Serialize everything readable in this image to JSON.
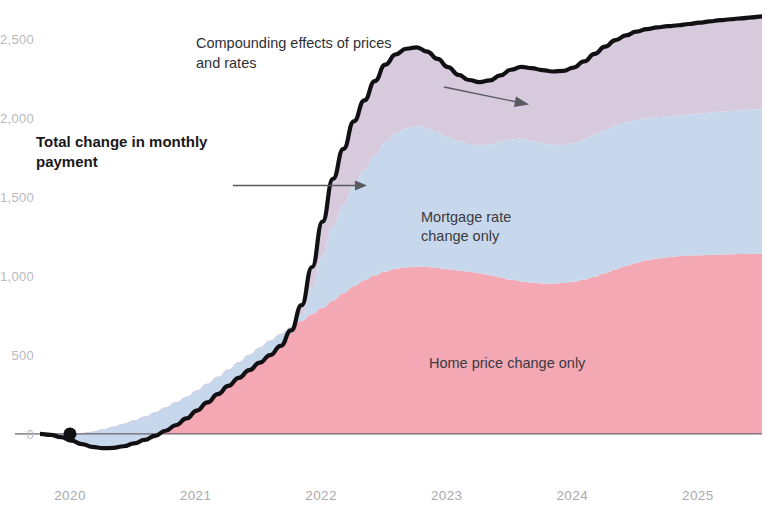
{
  "chart_data": {
    "type": "area",
    "title": "",
    "subtitle": "",
    "xlabel": "",
    "ylabel": "",
    "stacked": true,
    "grid": false,
    "legend": "inline-labels",
    "xlim": [
      2020.0,
      2025.75
    ],
    "ylim": [
      -330,
      2750
    ],
    "y_ticks": [
      0,
      500,
      1000,
      1500,
      2000,
      2500
    ],
    "y_tick_labels": [
      "0",
      "500",
      "1,000",
      "1,500",
      "2,000",
      "$2,500"
    ],
    "x_ticks": [
      2020,
      2021,
      2022,
      2023,
      2024,
      2025
    ],
    "x_tick_labels": [
      "2020",
      "2021",
      "2022",
      "2023",
      "2024",
      "2025"
    ],
    "colors": {
      "home_price": "#f4a8b4",
      "mortgage_rate": "#c8d8ec",
      "compounding": "#d6cadc",
      "total_line": "#111114",
      "zero_line": "#6e6470",
      "axis_text": "#b0b0b5"
    },
    "series": [
      {
        "name": "Home price change only",
        "key": "home_price",
        "color": "#f4a8b4",
        "values": [
          0,
          2,
          4,
          3,
          6,
          14,
          28,
          45,
          64,
          86,
          110,
          138,
          168,
          200,
          236,
          276,
          318,
          362,
          408,
          455,
          502,
          548,
          592,
          634,
          676,
          716,
          758,
          800,
          846,
          892,
          936,
          974,
          1006,
          1030,
          1046,
          1056,
          1060,
          1058,
          1052,
          1044,
          1036,
          1028,
          1018,
          1006,
          992,
          978,
          966,
          958,
          954,
          952,
          956,
          964,
          978,
          996,
          1018,
          1042,
          1064,
          1084,
          1100,
          1112,
          1120,
          1126,
          1130,
          1132,
          1134,
          1136,
          1138,
          1140,
          1142,
          1144
        ]
      },
      {
        "name": "Mortgage rate change only",
        "key": "mortgage_rate",
        "color": "#c8d8ec",
        "values": [
          0,
          -8,
          -24,
          -46,
          -70,
          -96,
          -118,
          -134,
          -142,
          -146,
          -148,
          -150,
          -148,
          -144,
          -138,
          -128,
          -118,
          -110,
          -104,
          -100,
          -98,
          -96,
          -92,
          -80,
          -40,
          40,
          170,
          330,
          470,
          560,
          640,
          700,
          760,
          820,
          860,
          880,
          890,
          880,
          860,
          840,
          820,
          810,
          812,
          830,
          860,
          890,
          905,
          900,
          890,
          880,
          875,
          878,
          888,
          900,
          908,
          912,
          910,
          905,
          900,
          896,
          894,
          892,
          894,
          898,
          902,
          906,
          908,
          910,
          912,
          914
        ]
      },
      {
        "name": "Compounding effects of prices and rates",
        "key": "compounding",
        "color": "#d6cadc",
        "values": [
          0,
          0,
          0,
          0,
          0,
          0,
          0,
          0,
          0,
          0,
          0,
          0,
          0,
          0,
          0,
          0,
          0,
          0,
          0,
          0,
          0,
          0,
          0,
          4,
          20,
          60,
          130,
          215,
          300,
          355,
          405,
          440,
          470,
          490,
          500,
          505,
          500,
          485,
          465,
          440,
          420,
          405,
          400,
          405,
          420,
          440,
          455,
          460,
          462,
          465,
          470,
          480,
          495,
          512,
          528,
          542,
          552,
          560,
          565,
          568,
          570,
          572,
          574,
          576,
          578,
          580,
          582,
          584,
          586,
          588
        ]
      }
    ],
    "total_line": {
      "name": "Total change in monthly payment",
      "values": [
        0,
        -6,
        -20,
        -43,
        -64,
        -82,
        -90,
        -89,
        -78,
        -60,
        -38,
        -12,
        20,
        56,
        98,
        148,
        200,
        252,
        304,
        355,
        404,
        452,
        500,
        558,
        656,
        816,
        1058,
        1345,
        1616,
        1807,
        1981,
        2114,
        2236,
        2340,
        2406,
        2441,
        2450,
        2423,
        2377,
        2324,
        2276,
        2243,
        2230,
        2241,
        2272,
        2308,
        2326,
        2318,
        2306,
        2297,
        2301,
        2322,
        2361,
        2408,
        2454,
        2496,
        2526,
        2549,
        2565,
        2576,
        2584,
        2590,
        2598,
        2606,
        2614,
        2622,
        2628,
        2634,
        2640,
        2646
      ]
    },
    "origin_marker": {
      "x": 2020.0,
      "y": 0,
      "shape": "dot"
    }
  },
  "annotations": [
    {
      "id": "compounding-annotation",
      "lines": [
        "Compounding effects of prices",
        "and rates"
      ],
      "bold": false,
      "x": 196,
      "y": 48
    },
    {
      "id": "total-annotation",
      "lines": [
        "Total change in monthly",
        "payment"
      ],
      "bold": true,
      "x": 36,
      "y": 147
    }
  ],
  "band_labels": [
    {
      "id": "mortgage-rate-label",
      "lines": [
        "Mortgage rate",
        "change only"
      ],
      "x": 421,
      "y": 222
    },
    {
      "id": "home-price-label",
      "lines": [
        "Home price change only"
      ],
      "x": 429,
      "y": 368
    }
  ],
  "axes": {
    "y_labels": [
      "$2,500",
      "2,000",
      "1,500",
      "1,000",
      "500",
      "0"
    ],
    "x_labels": [
      "2020",
      "2021",
      "2022",
      "2023",
      "2024",
      "2025"
    ]
  }
}
